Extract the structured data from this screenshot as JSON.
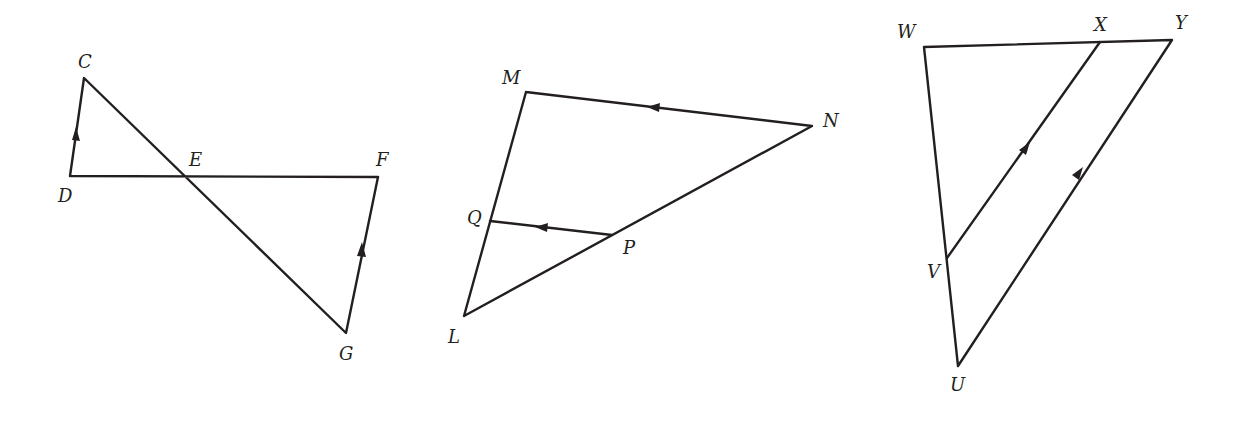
{
  "figures": [
    {
      "name": "bowtie",
      "points": {
        "C": {
          "label": "C",
          "x": 84,
          "y": 78
        },
        "D": {
          "label": "D",
          "x": 70,
          "y": 176
        },
        "E": {
          "label": "E",
          "x": 185,
          "y": 176
        },
        "F": {
          "label": "F",
          "x": 378,
          "y": 177
        },
        "G": {
          "label": "G",
          "x": 346,
          "y": 333
        }
      },
      "segments": [
        [
          "D",
          "C"
        ],
        [
          "C",
          "G"
        ],
        [
          "D",
          "F"
        ],
        [
          "G",
          "F"
        ]
      ],
      "parallel_marks": [
        "DC",
        "GF"
      ]
    },
    {
      "name": "triangle-LMN",
      "points": {
        "M": {
          "label": "M",
          "x": 526,
          "y": 92
        },
        "N": {
          "label": "N",
          "x": 812,
          "y": 126
        },
        "L": {
          "label": "L",
          "x": 464,
          "y": 316
        },
        "Q": {
          "label": "Q",
          "x": 490,
          "y": 221
        },
        "P": {
          "label": "P",
          "x": 612,
          "y": 235
        }
      },
      "segments": [
        [
          "M",
          "N"
        ],
        [
          "N",
          "L"
        ],
        [
          "L",
          "M"
        ],
        [
          "Q",
          "P"
        ]
      ],
      "parallel_marks": [
        "NM",
        "PQ"
      ]
    },
    {
      "name": "triangle-UWY",
      "points": {
        "W": {
          "label": "W",
          "x": 924,
          "y": 47
        },
        "X": {
          "label": "X",
          "x": 1100,
          "y": 42
        },
        "Y": {
          "label": "Y",
          "x": 1172,
          "y": 40
        },
        "V": {
          "label": "V",
          "x": 947,
          "y": 258
        },
        "U": {
          "label": "U",
          "x": 958,
          "y": 366
        }
      },
      "segments": [
        [
          "W",
          "Y"
        ],
        [
          "W",
          "U"
        ],
        [
          "U",
          "Y"
        ],
        [
          "V",
          "X"
        ]
      ],
      "parallel_marks": [
        "VX",
        "UY"
      ]
    }
  ],
  "colors": {
    "stroke": "#231f20",
    "background": "#ffffff"
  }
}
